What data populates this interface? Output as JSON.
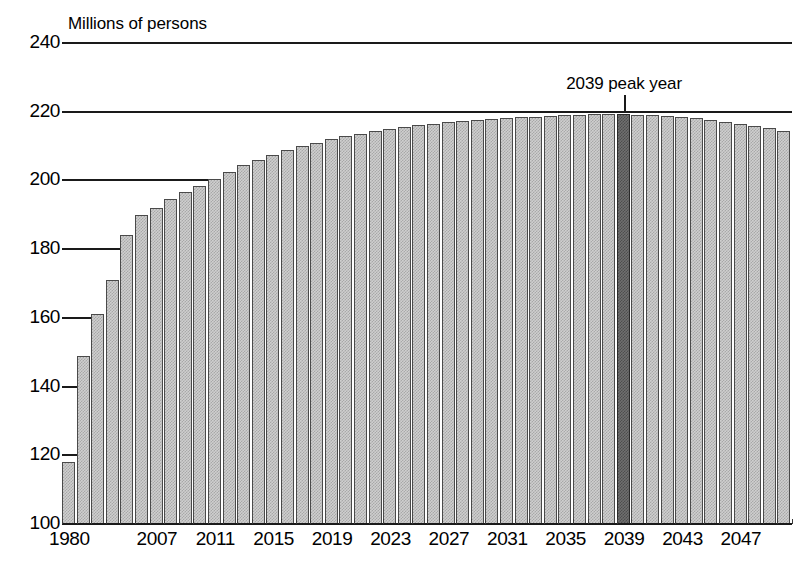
{
  "chart_data": {
    "type": "bar",
    "title": "",
    "axis_title": "Millions of persons",
    "xlabel": "",
    "ylabel": "Millions of persons",
    "ylim": [
      100,
      240
    ],
    "ytick_labels": [
      "240",
      "220",
      "200",
      "180",
      "160",
      "140",
      "120",
      "100"
    ],
    "ytick_values": [
      240,
      220,
      200,
      180,
      160,
      140,
      120,
      100
    ],
    "ytick_step": 20,
    "grid": "horizontal",
    "legend": "none",
    "bar_fill": "#cfcfcf",
    "highlight_fill": "#6f6f6f",
    "axis_color": "#1a1a1a",
    "xtick_labels": [
      "1980",
      "2007",
      "2011",
      "2015",
      "2019",
      "2023",
      "2027",
      "2031",
      "2035",
      "2039",
      "2043",
      "2047"
    ],
    "annotation": {
      "text": "2039 peak year",
      "target_year": "2039",
      "target_value": 219
    },
    "categories": [
      "1980",
      "1985",
      "1990",
      "1995",
      "2000",
      "2005",
      "2007",
      "2008",
      "2009",
      "2010",
      "2011",
      "2012",
      "2013",
      "2014",
      "2015",
      "2016",
      "2017",
      "2018",
      "2019",
      "2020",
      "2021",
      "2022",
      "2023",
      "2024",
      "2025",
      "2026",
      "2027",
      "2028",
      "2029",
      "2030",
      "2031",
      "2032",
      "2033",
      "2034",
      "2035",
      "2036",
      "2037",
      "2038",
      "2039",
      "2040",
      "2041",
      "2042",
      "2043",
      "2044",
      "2045",
      "2046",
      "2047",
      "2048",
      "2049",
      "2050"
    ],
    "values": [
      118,
      149,
      161,
      171,
      184,
      190,
      192,
      194.5,
      196.5,
      198.5,
      200.5,
      202.5,
      204.5,
      206,
      207.5,
      208.8,
      210,
      211,
      212,
      212.8,
      213.6,
      214.3,
      215,
      215.5,
      216,
      216.5,
      216.9,
      217.3,
      217.6,
      217.9,
      218.2,
      218.4,
      218.6,
      218.8,
      219,
      219.1,
      219.2,
      219.2,
      219.2,
      219.1,
      219,
      218.8,
      218.5,
      218.1,
      217.6,
      217,
      216.4,
      215.8,
      215.2,
      214.5
    ],
    "highlight_index": 38,
    "n_bars": 50
  }
}
